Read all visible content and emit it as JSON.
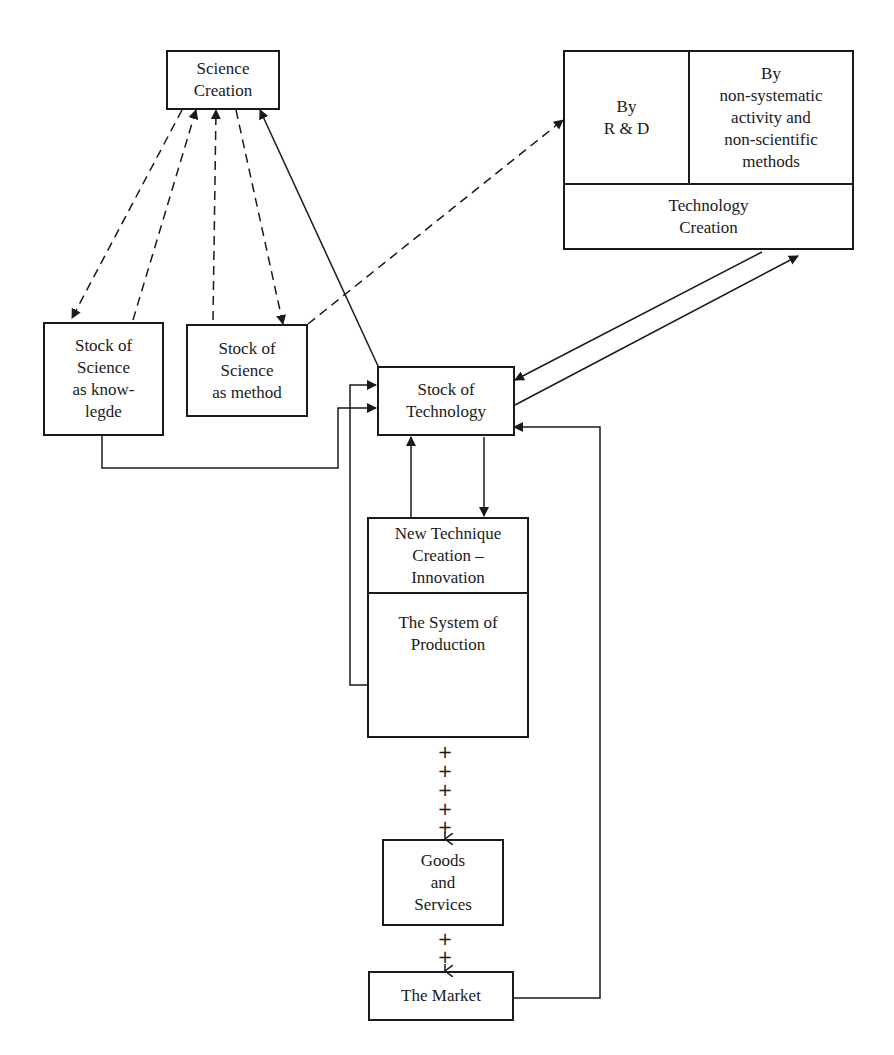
{
  "nodes": {
    "science_creation": "Science\nCreation",
    "tech_by_rd": "By\nR & D",
    "tech_by_nonsystematic": "By\nnon-systematic\nactivity and\nnon-scientific\nmethods",
    "technology_creation": "Technology\nCreation",
    "stock_science_knowledge": "Stock of\nScience\nas know-\nlegde",
    "stock_science_method": "Stock of\nScience\nas method",
    "stock_technology": "Stock of\nTechnology",
    "new_technique": "New Technique\nCreation –\nInnovation",
    "system_production": "The System of\nProduction",
    "goods_services": "Goods\nand\nServices",
    "market": "The Market"
  },
  "connectors": {
    "plus": "+"
  }
}
